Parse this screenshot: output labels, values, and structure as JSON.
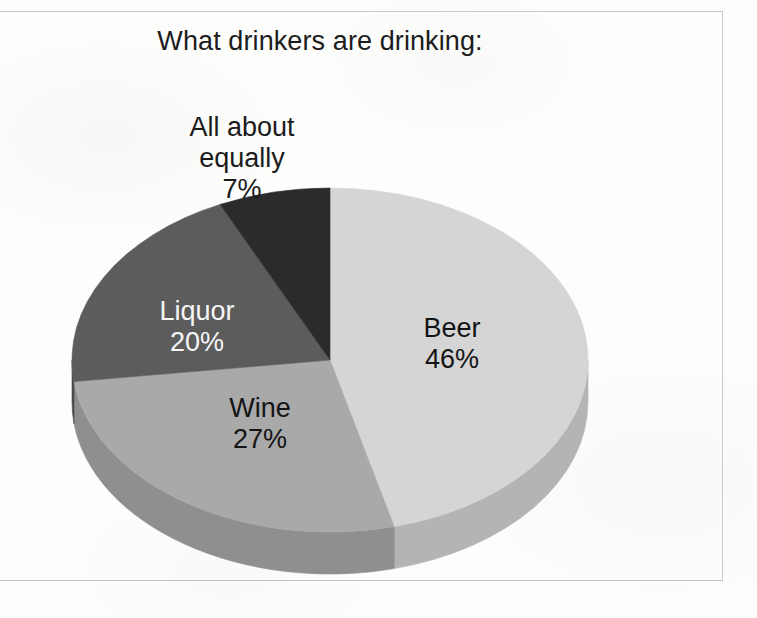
{
  "chart_data": {
    "type": "pie",
    "title": "What drinkers are drinking:",
    "xlabel": "",
    "ylabel": "",
    "legend_position": "none",
    "grid": false,
    "labels_on_slices": true,
    "start_angle_deg": 0,
    "direction": "clockwise",
    "three_d": true,
    "categories": [
      "Beer",
      "Wine",
      "Liquor",
      "All about equally"
    ],
    "values": [
      46,
      27,
      20,
      7
    ],
    "value_labels": [
      "46%",
      "27%",
      "20%",
      "7%"
    ],
    "colors": [
      "#d5d5d5",
      "#a9a9a9",
      "#5c5c5c",
      "#2b2b2b"
    ],
    "side_colors": [
      "#b4b4b4",
      "#8f8f8f",
      "#4c4c4c",
      "#232323"
    ],
    "label_text_colors": [
      "#141414",
      "#141414",
      "#f6f6f6",
      "#1b1b1b"
    ],
    "slices": [
      {
        "name": "Beer",
        "value": 46,
        "percent_label": "46%",
        "color": "#d5d5d5",
        "label_placement": "inside"
      },
      {
        "name": "Wine",
        "value": 27,
        "percent_label": "27%",
        "color": "#a9a9a9",
        "label_placement": "inside"
      },
      {
        "name": "Liquor",
        "value": 20,
        "percent_label": "20%",
        "color": "#5c5c5c",
        "label_placement": "inside"
      },
      {
        "name": "All about equally",
        "value": 7,
        "percent_label": "7%",
        "color": "#2b2b2b",
        "label_placement": "outside-top"
      }
    ],
    "total": 100,
    "units": "percent"
  },
  "header": {
    "title": "What drinkers are drinking:"
  },
  "labels": {
    "equally": {
      "line1": "All about",
      "line2": "equally",
      "percent": "7%"
    },
    "beer": {
      "name": "Beer",
      "percent": "46%"
    },
    "wine": {
      "name": "Wine",
      "percent": "27%"
    },
    "liquor": {
      "name": "Liquor",
      "percent": "20%"
    }
  }
}
